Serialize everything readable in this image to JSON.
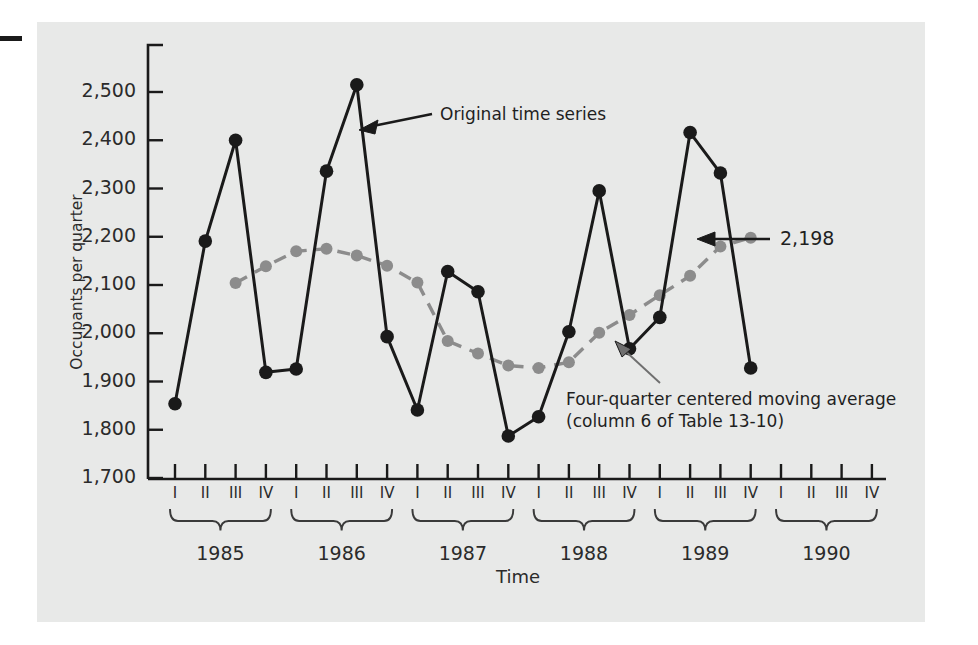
{
  "figure": {
    "panel_color": "#e8e9e8",
    "series_color_original": "#1a1a1a",
    "series_color_moving_average": "#8c8c8c"
  },
  "axes": {
    "ylabel": "Occupants per quarter",
    "xlabel": "Time",
    "ytick_labels": [
      "2,500",
      "2,400",
      "2,300",
      "2,200",
      "2,100",
      "2,000",
      "1,900",
      "1,800",
      "1,700"
    ],
    "quarter_labels": [
      "I",
      "II",
      "III",
      "IV"
    ],
    "year_labels": [
      "1985",
      "1986",
      "1987",
      "1988",
      "1989",
      "1990"
    ]
  },
  "annotations": {
    "original_series": "Original time series",
    "value_callout": "2,198",
    "moving_average_line1": "Four-quarter centered moving average",
    "moving_average_line2": "(column 6 of Table 13-10)"
  },
  "chart_data": {
    "type": "line",
    "title": "",
    "xlabel": "Time",
    "ylabel": "Occupants per quarter",
    "ylim": [
      1700,
      2550
    ],
    "yticks": [
      1700,
      1800,
      1900,
      2000,
      2100,
      2200,
      2300,
      2400,
      2500
    ],
    "grid": false,
    "legend": "annotations",
    "x": [
      "1985 I",
      "1985 II",
      "1985 III",
      "1985 IV",
      "1986 I",
      "1986 II",
      "1986 III",
      "1986 IV",
      "1987 I",
      "1987 II",
      "1987 III",
      "1987 IV",
      "1988 I",
      "1988 II",
      "1988 III",
      "1988 IV",
      "1989 I",
      "1989 II",
      "1989 III",
      "1989 IV",
      "1990 I",
      "1990 II",
      "1990 III",
      "1990 IV"
    ],
    "series": [
      {
        "name": "Original time series",
        "color": "#1a1a1a",
        "style": "solid",
        "marker": "circle",
        "values": [
          1854,
          2191,
          2400,
          1919,
          1926,
          2336,
          2515,
          1993,
          1841,
          2128,
          2086,
          1787,
          1827,
          2003,
          2295,
          1968,
          2033,
          2416,
          2332,
          1928,
          null,
          null,
          null,
          null
        ]
      },
      {
        "name": "Four-quarter centered moving average",
        "color": "#8c8c8c",
        "style": "dashed",
        "marker": "circle",
        "values": [
          null,
          null,
          2104,
          2139,
          2170,
          2175,
          2161,
          2140,
          2105,
          1984,
          1958,
          1933,
          1928,
          1940,
          2001,
          2038,
          2079,
          2119,
          2180,
          2198,
          null,
          null,
          null,
          null
        ]
      }
    ],
    "callouts": [
      {
        "label": "2,198",
        "series": "Four-quarter centered moving average",
        "x": "1989 IV",
        "y": 2198
      }
    ]
  }
}
